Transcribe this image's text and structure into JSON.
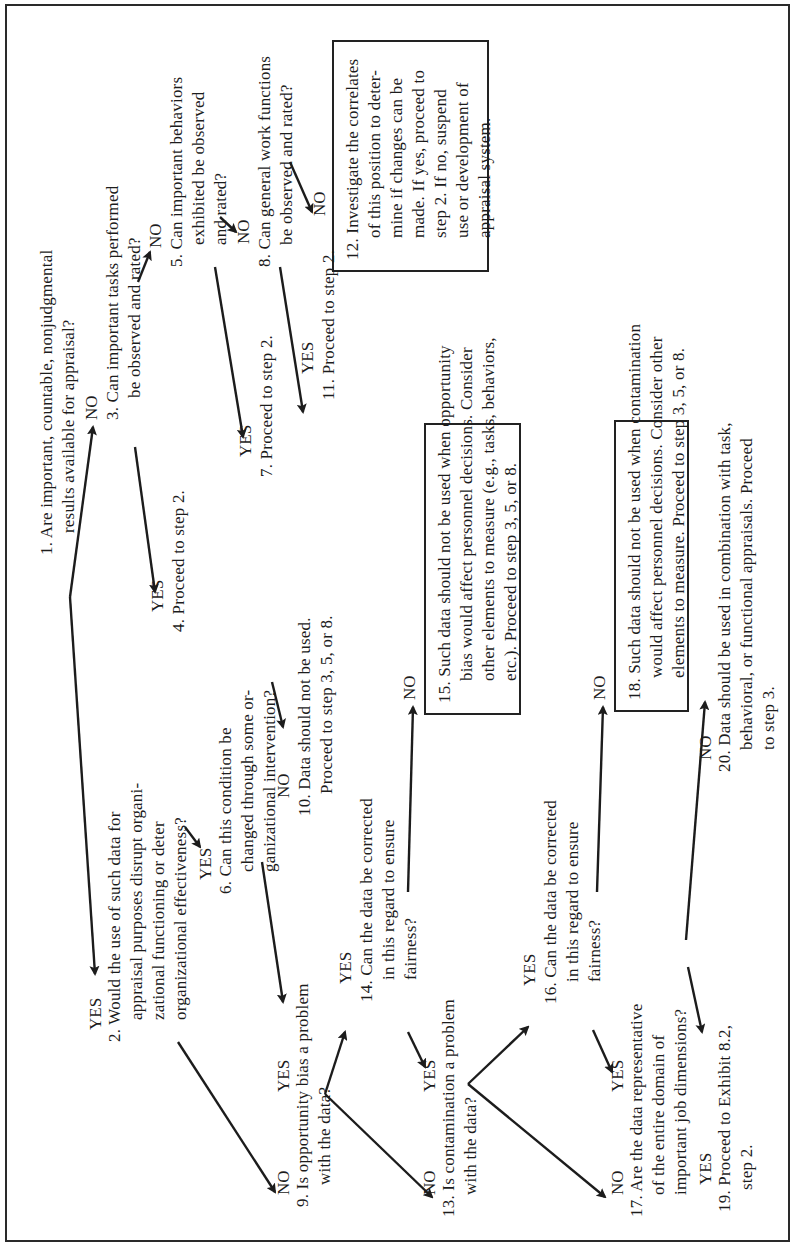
{
  "flowchart": {
    "orientation": "rotated 90 degrees counter-clockwise",
    "nodes": {
      "n1": {
        "num": "1.",
        "lines": [
          "Are important, countable, nonjudgmental",
          "results available for appraisal?"
        ]
      },
      "n2": {
        "num": "2.",
        "lines": [
          "Would the use of such data for",
          "appraisal purposes disrupt organi-",
          "zational functioning or deter",
          "organizational effectiveness?"
        ]
      },
      "n3": {
        "num": "3.",
        "lines": [
          "Can important tasks performed",
          "be observed and rated?"
        ]
      },
      "n4": {
        "num": "4.",
        "lines": [
          "Proceed to step 2."
        ]
      },
      "n5": {
        "num": "5.",
        "lines": [
          "Can important behaviors",
          "exhibited be observed",
          "and rated?"
        ]
      },
      "n6": {
        "num": "6.",
        "lines": [
          "Can this condition be",
          "changed through some or-",
          "ganizational intervention?"
        ]
      },
      "n7": {
        "num": "7.",
        "lines": [
          "Proceed to step 2."
        ]
      },
      "n8": {
        "num": "8.",
        "lines": [
          "Can general work functions",
          "be observed and rated?"
        ]
      },
      "n9": {
        "num": "9.",
        "lines": [
          "Is opportunity bias a problem",
          "with the data?"
        ]
      },
      "n10": {
        "num": "10.",
        "lines": [
          "Data should not be used.",
          "Proceed to step 3, 5, or 8."
        ]
      },
      "n11": {
        "num": "11.",
        "lines": [
          "Proceed to step 2."
        ]
      },
      "n12": {
        "num": "12.",
        "lines": [
          "Investigate the correlates",
          "of this position to deter-",
          "mine if changes can be",
          "made. If yes, proceed to",
          "step 2. If no, suspend",
          "use or development of",
          "appraisal system."
        ]
      },
      "n13": {
        "num": "13.",
        "lines": [
          "Is contamination a problem",
          "with the data?"
        ]
      },
      "n14": {
        "num": "14.",
        "lines": [
          "Can the data be corrected",
          "in this regard to ensure",
          "fairness?"
        ]
      },
      "n15": {
        "num": "15.",
        "lines": [
          "Such data should not be used when opportunity",
          "bias would affect personnel decisions. Consider",
          "other elements to measure (e.g., tasks, behaviors,",
          "etc.). Proceed to step 3, 5, or 8."
        ]
      },
      "n16": {
        "num": "16.",
        "lines": [
          "Can the data be corrected",
          "in this regard to ensure",
          "fairness?"
        ]
      },
      "n17": {
        "num": "17.",
        "lines": [
          "Are the data representative",
          "of the entire domain of",
          "important job dimensions?"
        ]
      },
      "n18": {
        "num": "18.",
        "lines": [
          "Such data should not be used when contamination",
          "would affect personnel decisions. Consider other",
          "elements to measure. Proceed to step 3, 5, or 8."
        ]
      },
      "n19": {
        "num": "19.",
        "lines": [
          "Proceed to Exhibit 8.2,",
          "step 2."
        ]
      },
      "n20": {
        "num": "20.",
        "lines": [
          "Data should be used in combination with task,",
          "behavioral, or functional appraisals. Proceed",
          "to step 3."
        ]
      }
    },
    "labels": {
      "yes": "YES",
      "no": "NO"
    },
    "edges": [
      {
        "from": "1",
        "to": "3",
        "label": "NO"
      },
      {
        "from": "1",
        "to": "2",
        "label": "YES"
      },
      {
        "from": "3",
        "to": "5",
        "label": "NO"
      },
      {
        "from": "3",
        "to": "4",
        "label": "YES"
      },
      {
        "from": "5",
        "to": "8",
        "label": "NO"
      },
      {
        "from": "5",
        "to": "7",
        "label": "YES"
      },
      {
        "from": "8",
        "to": "12",
        "label": "NO"
      },
      {
        "from": "8",
        "to": "11",
        "label": "YES"
      },
      {
        "from": "2",
        "to": "6",
        "label": "YES"
      },
      {
        "from": "2",
        "to": "9",
        "label": "NO"
      },
      {
        "from": "6",
        "to": "10",
        "label": "NO"
      },
      {
        "from": "6",
        "to": "9",
        "label": "YES"
      },
      {
        "from": "9",
        "to": "14",
        "label": "YES"
      },
      {
        "from": "9",
        "to": "13",
        "label": "NO"
      },
      {
        "from": "14",
        "to": "15",
        "label": "NO"
      },
      {
        "from": "14",
        "to": "13",
        "label": "YES"
      },
      {
        "from": "13",
        "to": "16",
        "label": "YES"
      },
      {
        "from": "13",
        "to": "17",
        "label": "NO"
      },
      {
        "from": "16",
        "to": "18",
        "label": "NO"
      },
      {
        "from": "16",
        "to": "17",
        "label": "YES"
      },
      {
        "from": "17",
        "to": "20",
        "label": "NO"
      },
      {
        "from": "17",
        "to": "19",
        "label": "YES"
      }
    ]
  }
}
